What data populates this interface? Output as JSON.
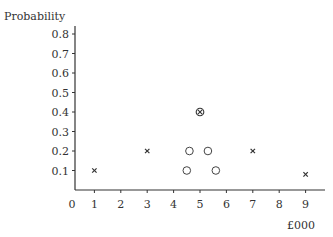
{
  "chart_data": {
    "type": "scatter",
    "title": "",
    "ylabel": "Probability",
    "xlabel": "£000",
    "xlim": [
      0,
      9.5
    ],
    "ylim": [
      0,
      0.85
    ],
    "xticks": [
      0,
      1,
      2,
      3,
      4,
      5,
      6,
      7,
      8,
      9
    ],
    "yticks": [
      0.1,
      0.2,
      0.3,
      0.4,
      0.5,
      0.6,
      0.7,
      0.8
    ],
    "grid": false,
    "legend": null,
    "series": [
      {
        "name": "crosses",
        "marker": "x",
        "points": [
          {
            "x": 1,
            "y": 0.1
          },
          {
            "x": 3,
            "y": 0.2
          },
          {
            "x": 7,
            "y": 0.2
          },
          {
            "x": 9,
            "y": 0.08
          }
        ]
      },
      {
        "name": "circles",
        "marker": "o",
        "points": [
          {
            "x": 4.5,
            "y": 0.1
          },
          {
            "x": 4.6,
            "y": 0.2
          },
          {
            "x": 5.3,
            "y": 0.2
          },
          {
            "x": 5.6,
            "y": 0.1
          }
        ]
      },
      {
        "name": "circled-cross",
        "marker": "circled-x",
        "points": [
          {
            "x": 5,
            "y": 0.4
          }
        ]
      }
    ]
  },
  "layout": {
    "origin_px": [
      68,
      190
    ],
    "x_px_per_unit": 26.4,
    "y_px_per_unit": 195,
    "axis_x_start": 75,
    "axis_x_end": 325,
    "axis_y_top": 26
  }
}
